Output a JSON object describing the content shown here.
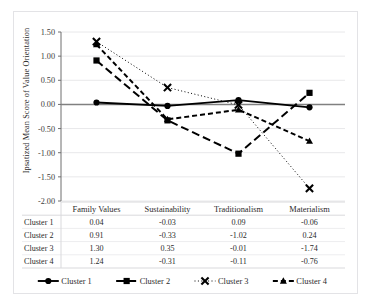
{
  "chart_data": {
    "type": "line",
    "title": "",
    "xlabel": "",
    "ylabel": "Ipsatized Mean Score of Value Orientation",
    "categories": [
      "Family Values",
      "Sustainability",
      "Traditionalism",
      "Materialism"
    ],
    "ylim": [
      -2.0,
      1.5
    ],
    "ytick_labels": [
      "1.50",
      "1.00",
      "0.50",
      "0.00",
      "-0.50",
      "-1.00",
      "-1.50",
      "-2.00"
    ],
    "ytick_values": [
      1.5,
      1.0,
      0.5,
      0.0,
      -0.5,
      -1.0,
      -1.5,
      -2.0
    ],
    "grid": "horizontal",
    "legend_position": "bottom",
    "series": [
      {
        "name": "Cluster 1",
        "values": [
          0.04,
          -0.03,
          0.09,
          -0.06
        ],
        "marker": "circle",
        "line": "solid"
      },
      {
        "name": "Cluster 2",
        "values": [
          0.91,
          -0.33,
          -1.02,
          0.24
        ],
        "marker": "square",
        "line": "long-dash"
      },
      {
        "name": "Cluster 3",
        "values": [
          1.3,
          0.35,
          -0.01,
          -1.74
        ],
        "marker": "x",
        "line": "dotted"
      },
      {
        "name": "Cluster 4",
        "values": [
          1.24,
          -0.31,
          -0.11,
          -0.76
        ],
        "marker": "triangle",
        "line": "dash"
      }
    ]
  },
  "data_table": {
    "row_header_label": "",
    "columns": [
      "Family Values",
      "Sustainability",
      "Traditionalism",
      "Materialism"
    ],
    "rows": [
      {
        "label": "Cluster 1",
        "values": [
          "0.04",
          "-0.03",
          "0.09",
          "-0.06"
        ]
      },
      {
        "label": "Cluster 2",
        "values": [
          "0.91",
          "-0.33",
          "-1.02",
          "0.24"
        ]
      },
      {
        "label": "Cluster 3",
        "values": [
          "1.30",
          "0.35",
          "-0.01",
          "-1.74"
        ]
      },
      {
        "label": "Cluster 4",
        "values": [
          "1.24",
          "-0.31",
          "-0.11",
          "-0.76"
        ]
      }
    ]
  },
  "legend": {
    "items": [
      {
        "label": "Cluster 1",
        "marker": "circle",
        "line": "solid"
      },
      {
        "label": "Cluster 2",
        "marker": "square",
        "line": "long-dash"
      },
      {
        "label": "Cluster 3",
        "marker": "x",
        "line": "dotted"
      },
      {
        "label": "Cluster 4",
        "marker": "triangle",
        "line": "dash"
      }
    ]
  },
  "colors": {
    "series": "#000000",
    "zero_line": "#808080",
    "grid": "#e8e8ea",
    "border": "#e3e3e6",
    "text": "#2b2b2b"
  }
}
